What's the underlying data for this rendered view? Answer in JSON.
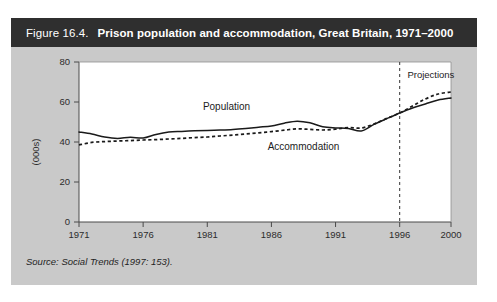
{
  "figure": {
    "number": "Figure 16.4.",
    "title": "Prison population and accommodation, Great Britain, 1971–2000",
    "source": "Source: Social Trends (1997: 153).",
    "panel_bg": "#c9c9c9",
    "titlebar_bg": "#2f2f2f",
    "plot_bg": "#ffffff"
  },
  "chart_data": {
    "type": "line",
    "title": "Prison population and accommodation, Great Britain, 1971–2000",
    "xlabel": "",
    "ylabel": "(000s)",
    "xlim": [
      1971,
      2000
    ],
    "ylim": [
      0,
      80
    ],
    "yticks": [
      0,
      20,
      40,
      60,
      80
    ],
    "ytick_labels": [
      "0",
      "20",
      "40",
      "60",
      "80"
    ],
    "xticks": [
      1971,
      1976,
      1981,
      1986,
      1991,
      1996,
      2000
    ],
    "xtick_labels": [
      "1971",
      "1976",
      "1981",
      "1986",
      "1991",
      "1996",
      "2000"
    ],
    "grid": false,
    "legend": "inline-labels",
    "x": [
      1971,
      1972,
      1973,
      1974,
      1975,
      1976,
      1977,
      1978,
      1979,
      1980,
      1981,
      1982,
      1983,
      1984,
      1985,
      1986,
      1987,
      1988,
      1989,
      1990,
      1991,
      1992,
      1993,
      1994,
      1995,
      1996,
      1997,
      1998,
      1999,
      2000
    ],
    "series": [
      {
        "name": "Population",
        "style": "solid",
        "color": "#1a1a1a",
        "values": [
          45.0,
          44.0,
          42.5,
          41.8,
          42.4,
          42.0,
          43.8,
          45.0,
          45.3,
          45.6,
          45.8,
          46.0,
          46.3,
          46.8,
          47.4,
          48.0,
          49.4,
          50.4,
          49.6,
          47.6,
          47.0,
          46.8,
          45.5,
          48.8,
          51.7,
          54.5,
          57.0,
          59.0,
          61.0,
          62.0
        ]
      },
      {
        "name": "Accommodation",
        "style": "dotted",
        "color": "#1a1a1a",
        "values": [
          38.5,
          39.8,
          40.2,
          40.5,
          40.7,
          41.0,
          41.2,
          41.5,
          41.8,
          42.2,
          42.5,
          43.0,
          43.5,
          44.0,
          44.6,
          45.2,
          45.9,
          46.6,
          46.3,
          46.0,
          46.4,
          47.2,
          47.0,
          49.0,
          51.8,
          54.5,
          58.0,
          61.5,
          64.0,
          65.0
        ]
      }
    ],
    "annotations": [
      {
        "name": "population-label",
        "text": "Population",
        "x": 1982.5,
        "y": 56
      },
      {
        "name": "accommodation-label",
        "text": "Accommodation",
        "x": 1988.5,
        "y": 36
      },
      {
        "name": "projections-label",
        "text": "Projections",
        "x": 1996.6,
        "y": 72
      }
    ],
    "projection_divider": {
      "x": 1996,
      "style": "dashed",
      "label": "Projections"
    }
  }
}
